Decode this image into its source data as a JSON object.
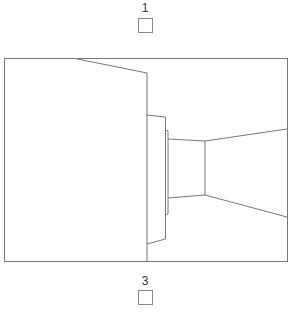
{
  "options": [
    {
      "label": "1",
      "checked": false
    },
    {
      "label": "3",
      "checked": false
    }
  ],
  "scene": {
    "description": "line drawing of corridor view with wall and door panel",
    "stroke_color": "#777777"
  }
}
